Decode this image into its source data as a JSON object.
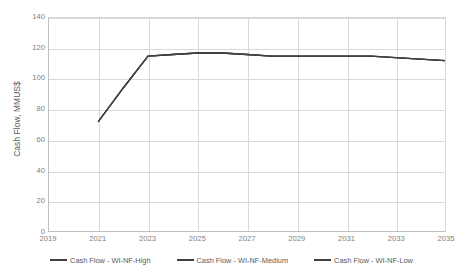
{
  "chart_data": {
    "type": "line",
    "title": "",
    "xlabel": "",
    "ylabel": "Cash Flow, MMUS$",
    "xlim": [
      2019,
      2035
    ],
    "ylim": [
      0,
      140
    ],
    "grid": true,
    "legend_position": "bottom",
    "x_tick_labels": [
      "2019",
      "2021",
      "2023",
      "2025",
      "2027",
      "2029",
      "2031",
      "2033",
      "2035"
    ],
    "y_tick_labels": [
      "0",
      "20",
      "40",
      "60",
      "80",
      "100",
      "120",
      "140"
    ],
    "x": [
      2021,
      2022,
      2023,
      2024,
      2025,
      2026,
      2027,
      2028,
      2029,
      2030,
      2031,
      2032,
      2033,
      2034,
      2035
    ],
    "series": [
      {
        "name": "Cash Flow - WI-NF-High",
        "color": "#404040",
        "values": [
          72,
          94,
          115,
          116,
          117,
          117,
          116,
          115,
          115,
          115,
          115,
          115,
          114,
          113,
          112
        ]
      },
      {
        "name": "Cash Flow - WI-NF-Medium",
        "color": "#404040",
        "values": [
          72,
          94,
          115,
          116,
          117,
          117,
          116,
          115,
          115,
          115,
          115,
          115,
          114,
          113,
          112
        ]
      },
      {
        "name": "Cash Flow - WI-NF-Low",
        "color": "#404040",
        "values": [
          72,
          94,
          115,
          116,
          117,
          117,
          116,
          115,
          115,
          115,
          115,
          115,
          114,
          113,
          112
        ]
      }
    ]
  },
  "legend": {
    "entries": [
      {
        "label": "Cash Flow - WI-NF-High"
      },
      {
        "label": "Cash Flow - WI-NF-Medium"
      },
      {
        "label": "Cash Flow - WI-NF-Low"
      }
    ]
  },
  "axes": {
    "y_title": "Cash Flow, MMUS$"
  }
}
